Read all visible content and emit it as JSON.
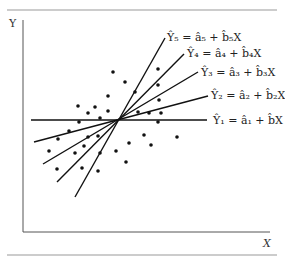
{
  "axes": {
    "y_label": "Y",
    "x_label": "X"
  },
  "lines": [
    {
      "label": "Ŷ₁ = â₁ + b̂X",
      "x1": 31,
      "y1": 120,
      "x2": 207,
      "y2": 120,
      "lx": 213,
      "ly": 124
    },
    {
      "label": "Ŷ₂ = â₂ + b̂₂X",
      "x1": 34,
      "y1": 142,
      "x2": 208,
      "y2": 96,
      "lx": 211,
      "ly": 99
    },
    {
      "label": "Ŷ₃ = â₃ + b̂₃X",
      "x1": 43,
      "y1": 164,
      "x2": 198,
      "y2": 72,
      "lx": 201,
      "ly": 76
    },
    {
      "label": "Ŷ₄ = â₄ + b̂₄X",
      "x1": 57,
      "y1": 182,
      "x2": 184,
      "y2": 54,
      "lx": 187,
      "ly": 57
    },
    {
      "label": "Ŷ₅ = â₅ + b̂₅X",
      "x1": 75,
      "y1": 197,
      "x2": 165,
      "y2": 38,
      "lx": 167,
      "ly": 41
    }
  ],
  "points": [
    [
      113,
      72
    ],
    [
      125,
      82
    ],
    [
      158,
      69
    ],
    [
      158,
      85
    ],
    [
      135,
      92
    ],
    [
      108,
      96
    ],
    [
      159,
      100
    ],
    [
      78,
      106
    ],
    [
      95,
      107
    ],
    [
      88,
      113
    ],
    [
      108,
      111
    ],
    [
      138,
      112
    ],
    [
      149,
      113
    ],
    [
      161,
      113
    ],
    [
      100,
      118
    ],
    [
      79,
      122
    ],
    [
      158,
      122
    ],
    [
      69,
      131
    ],
    [
      58,
      139
    ],
    [
      88,
      137
    ],
    [
      98,
      136
    ],
    [
      49,
      151
    ],
    [
      75,
      153
    ],
    [
      84,
      146
    ],
    [
      100,
      153
    ],
    [
      116,
      151
    ],
    [
      129,
      143
    ],
    [
      144,
      135
    ],
    [
      151,
      145
    ],
    [
      177,
      137
    ],
    [
      126,
      162
    ],
    [
      57,
      169
    ],
    [
      82,
      168
    ],
    [
      98,
      171
    ]
  ]
}
